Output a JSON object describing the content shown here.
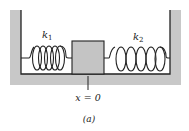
{
  "figure": {
    "caption": "(a)",
    "colors": {
      "wall_fill": "#c8c8c8",
      "block_fill": "#c4c4c4",
      "line": "#222222",
      "background": "#ffffff"
    }
  },
  "springs": [
    {
      "id": "left",
      "label_base": "k",
      "label_sub": "1",
      "state": "compressed",
      "loops": 5
    },
    {
      "id": "right",
      "label_base": "k",
      "label_sub": "2",
      "state": "stretched",
      "loops": 5
    }
  ],
  "block": {
    "label": ""
  },
  "position_marker": {
    "text": "x = 0"
  }
}
